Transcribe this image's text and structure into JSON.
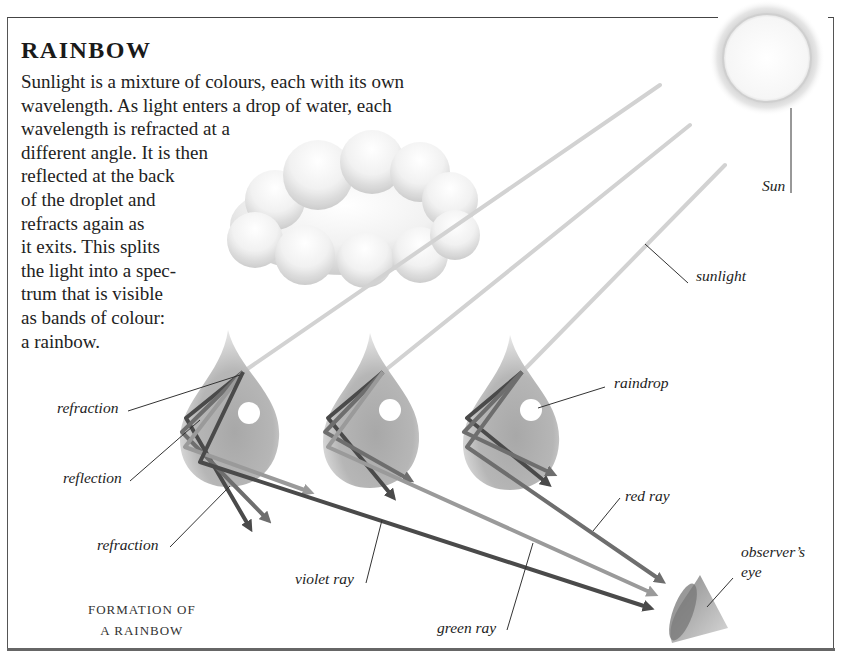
{
  "header": {
    "title": "RAINBOW"
  },
  "intro": {
    "lines": [
      "Sunlight is a mixture of colours, each with its own",
      "wavelength. As light enters a drop of water, each",
      "wavelength is refracted at a",
      "different angle. It is then",
      "reflected at the back",
      "of the droplet and",
      "refracts again as",
      "it exits. This splits",
      "the light into a spec-",
      "trum that is visible",
      "as bands of colour:",
      "a rainbow."
    ]
  },
  "labels": {
    "sun": "Sun",
    "sunlight": "sunlight",
    "raindrop": "raindrop",
    "refraction_in": "refraction",
    "reflection": "reflection",
    "refraction_out": "refraction",
    "violet_ray": "violet ray",
    "green_ray": "green ray",
    "red_ray": "red ray",
    "observer_line1": "observer’s",
    "observer_line2": "eye"
  },
  "caption": {
    "line1": "FORMATION OF",
    "line2": "A RAINBOW"
  },
  "colors": {
    "frame": "#555555",
    "ray_dark": "#4a4a4a",
    "ray_mid": "#6e6e6e",
    "ray_light": "#9a9a9a",
    "sunlight": "#d4d4d4",
    "drop": "#9e9e9e"
  }
}
